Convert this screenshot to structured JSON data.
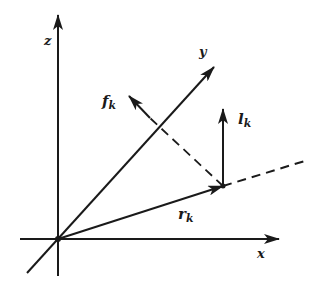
{
  "diagram": {
    "title": "",
    "colors": {
      "ink": "#1a1a1a",
      "background": "#ffffff"
    },
    "origin": {
      "x": 58,
      "y": 239
    },
    "axes": [
      {
        "id": "z",
        "label": "z",
        "from": [
          58,
          276
        ],
        "to": [
          58,
          15
        ],
        "label_pos": [
          44,
          34
        ]
      },
      {
        "id": "x",
        "label": "x",
        "from": [
          20,
          239
        ],
        "to": [
          279,
          239
        ],
        "label_pos": [
          257,
          247
        ]
      },
      {
        "id": "y",
        "label": "y",
        "from": [
          27,
          273
        ],
        "to": [
          214,
          67
        ],
        "label_pos": [
          199,
          45
        ]
      }
    ],
    "vectors": [
      {
        "id": "r_k",
        "base": "r",
        "sub": "k",
        "from": [
          58,
          239
        ],
        "to": [
          223,
          186
        ],
        "style": "solid",
        "label_pos": [
          178,
          207
        ]
      },
      {
        "id": "l_k",
        "base": "l",
        "sub": "k",
        "from": [
          223,
          186
        ],
        "to": [
          223,
          109
        ],
        "style": "solid",
        "label_pos": [
          238,
          112
        ]
      },
      {
        "id": "f_k",
        "base": "f",
        "sub": "k",
        "from": [
          150,
          118
        ],
        "to": [
          129,
          96
        ],
        "style": "solid",
        "label_pos": [
          102,
          94
        ]
      }
    ],
    "dashed_lines": [
      {
        "id": "r_k-extension",
        "from": [
          223,
          186
        ],
        "to": [
          308,
          160
        ]
      },
      {
        "id": "f_k-projection",
        "from": [
          223,
          186
        ],
        "to": [
          150,
          118
        ]
      }
    ],
    "labels": {
      "z": "z",
      "x": "x",
      "y": "y",
      "r_base": "r",
      "r_sub": "k",
      "l_base": "l",
      "l_sub": "k",
      "f_base": "f",
      "f_sub": "k"
    }
  }
}
